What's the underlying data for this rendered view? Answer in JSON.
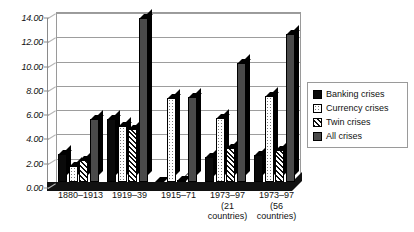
{
  "chart_data": {
    "type": "bar",
    "title": "",
    "xlabel": "",
    "ylabel": "",
    "ylim": [
      0,
      14
    ],
    "ytick_step": 2,
    "ytick_labels": [
      "0.00",
      "2.00",
      "4.00",
      "6.00",
      "8.00",
      "10.00",
      "12.00",
      "14.00"
    ],
    "grid": true,
    "legend_position": "right",
    "categories": [
      "1880–1913",
      "1919–39",
      "1915–71",
      "1973–97",
      "1973–97"
    ],
    "category_sublabels": [
      "",
      "",
      "",
      "(21 countries)",
      "(56 countries)"
    ],
    "series": [
      {
        "name": "Banking crises",
        "values": [
          2.3,
          5.2,
          0.0,
          2.1,
          2.2
        ]
      },
      {
        "name": "Currency crises",
        "values": [
          1.3,
          4.6,
          6.9,
          5.3,
          7.1
        ]
      },
      {
        "name": "Twin crises",
        "values": [
          1.8,
          4.4,
          0.2,
          2.8,
          2.6
        ]
      },
      {
        "name": "All crises",
        "values": [
          5.2,
          13.5,
          7.0,
          9.8,
          12.2
        ]
      }
    ]
  },
  "legend": {
    "items": [
      {
        "label": "Banking crises",
        "pattern": "solid-black"
      },
      {
        "label": "Currency crises",
        "pattern": "white-dotted"
      },
      {
        "label": "Twin crises",
        "pattern": "diagonal-hatch"
      },
      {
        "label": "All crises",
        "pattern": "grey-stipple"
      }
    ]
  },
  "colors": {
    "banking": "#0a0a0a",
    "currency": "#ffffff",
    "twin": "#ffffff",
    "all": "#f2f2f2",
    "axis": "#9a9a9a",
    "grid": "#9d9d9d",
    "text": "#111111"
  }
}
